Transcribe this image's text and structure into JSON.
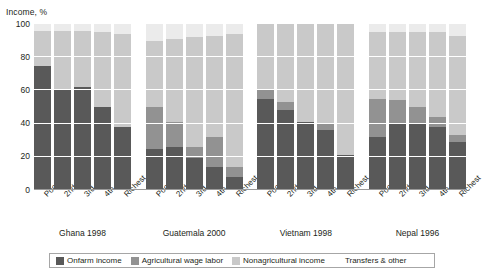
{
  "chart_data": {
    "type": "bar",
    "subtype": "stacked-bar-grouped",
    "title": "",
    "xlabel": "",
    "ylabel": "Income, %",
    "ylim": [
      0,
      100
    ],
    "yticks": [
      0,
      20,
      40,
      60,
      80,
      100
    ],
    "grid": true,
    "legend_position": "bottom",
    "categories": [
      "Poorest",
      "2nd",
      "3rd",
      "4th",
      "Richest"
    ],
    "groups": [
      {
        "name": "Ghana 1998",
        "bars": [
          {
            "category": "Poorest",
            "values": [
              75,
              0,
              21,
              4
            ]
          },
          {
            "category": "2nd",
            "values": [
              61,
              0,
              35,
              4
            ]
          },
          {
            "category": "3rd",
            "values": [
              62,
              0,
              34,
              4
            ]
          },
          {
            "category": "4th",
            "values": [
              50,
              0,
              45,
              5
            ]
          },
          {
            "category": "Richest",
            "values": [
              38,
              0,
              56,
              6
            ]
          }
        ]
      },
      {
        "name": "Guatemala 2000",
        "bars": [
          {
            "category": "Poorest",
            "values": [
              25,
              25,
              40,
              10
            ]
          },
          {
            "category": "2nd",
            "values": [
              26,
              15,
              50,
              9
            ]
          },
          {
            "category": "3rd",
            "values": [
              19,
              7,
              66,
              8
            ]
          },
          {
            "category": "4th",
            "values": [
              14,
              18,
              61,
              7
            ]
          },
          {
            "category": "Richest",
            "values": [
              8,
              6,
              80,
              6
            ]
          }
        ]
      },
      {
        "name": "Vietnam 1998",
        "bars": [
          {
            "category": "Poorest",
            "values": [
              55,
              6,
              39,
              0
            ]
          },
          {
            "category": "2nd",
            "values": [
              48,
              5,
              47,
              0
            ]
          },
          {
            "category": "3rd",
            "values": [
              41,
              0,
              59,
              0
            ]
          },
          {
            "category": "4th",
            "values": [
              36,
              4,
              60,
              0
            ]
          },
          {
            "category": "Richest",
            "values": [
              21,
              0,
              79,
              0
            ]
          }
        ]
      },
      {
        "name": "Nepal 1996",
        "bars": [
          {
            "category": "Poorest",
            "values": [
              32,
              23,
              40,
              5
            ]
          },
          {
            "category": "2nd",
            "values": [
              40,
              14,
              41,
              5
            ]
          },
          {
            "category": "3rd",
            "values": [
              40,
              10,
              45,
              5
            ]
          },
          {
            "category": "4th",
            "values": [
              38,
              6,
              51,
              5
            ]
          },
          {
            "category": "Richest",
            "values": [
              29,
              4,
              60,
              7
            ]
          }
        ]
      }
    ],
    "series": [
      {
        "name": "Onfarm income",
        "color": "#595959"
      },
      {
        "name": "Agricultural wage labor",
        "color": "#929292"
      },
      {
        "name": "Nonagricultural income",
        "color": "#c9c9c9"
      },
      {
        "name": "Transfers & other",
        "color": "#ffffff"
      }
    ]
  },
  "legend": {
    "items": [
      {
        "label": "Onfarm income"
      },
      {
        "label": "Agricultural wage labor"
      },
      {
        "label": "Nonagricultural income"
      },
      {
        "label": "Transfers & other"
      }
    ]
  }
}
